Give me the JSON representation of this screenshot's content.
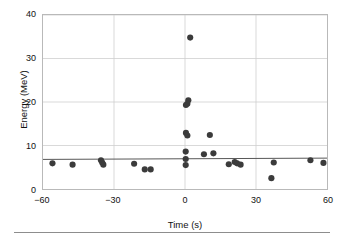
{
  "chart_data": {
    "type": "scatter",
    "title": "",
    "xlabel": "Time (s)",
    "ylabel": "Energy (MeV)",
    "xlim": [
      -60,
      60
    ],
    "ylim": [
      0,
      40
    ],
    "xticks": [
      -60,
      -30,
      0,
      30,
      60
    ],
    "yticks": [
      0,
      10,
      20,
      30,
      40
    ],
    "xtick_labels": [
      "−60",
      "−30",
      "0",
      "30",
      "60"
    ],
    "ytick_labels": [
      "0",
      "10",
      "20",
      "30",
      "40"
    ],
    "grid": true,
    "grid_color": "#cfcfcf",
    "legend": "none",
    "marker_color": "#3b3b3b",
    "marker_size": 3.1,
    "points": [
      {
        "x": -56.0,
        "y": 5.9
      },
      {
        "x": -47.5,
        "y": 5.6
      },
      {
        "x": -35.5,
        "y": 6.6
      },
      {
        "x": -35.0,
        "y": 6.1
      },
      {
        "x": -34.5,
        "y": 5.6
      },
      {
        "x": -21.5,
        "y": 5.8
      },
      {
        "x": -17.0,
        "y": 4.5
      },
      {
        "x": -14.5,
        "y": 4.5
      },
      {
        "x": 0.4,
        "y": 19.3
      },
      {
        "x": 1.0,
        "y": 19.6
      },
      {
        "x": 1.4,
        "y": 20.4
      },
      {
        "x": 0.4,
        "y": 12.9
      },
      {
        "x": 1.0,
        "y": 12.3
      },
      {
        "x": 0.3,
        "y": 8.6
      },
      {
        "x": 0.3,
        "y": 6.9
      },
      {
        "x": 0.3,
        "y": 5.5
      },
      {
        "x": 2.2,
        "y": 34.8
      },
      {
        "x": 8.0,
        "y": 8.0
      },
      {
        "x": 10.5,
        "y": 12.4
      },
      {
        "x": 12.0,
        "y": 8.2
      },
      {
        "x": 18.5,
        "y": 5.7
      },
      {
        "x": 21.0,
        "y": 6.2
      },
      {
        "x": 22.0,
        "y": 5.9
      },
      {
        "x": 23.5,
        "y": 5.6
      },
      {
        "x": 36.5,
        "y": 2.5
      },
      {
        "x": 37.5,
        "y": 6.1
      },
      {
        "x": 53.0,
        "y": 6.6
      },
      {
        "x": 58.5,
        "y": 6.0
      }
    ],
    "trend_line": {
      "name": "fit-line",
      "color": "#555555",
      "x_start": -60,
      "y_start": 6.8,
      "x_end": 60,
      "y_end": 7.1
    }
  }
}
